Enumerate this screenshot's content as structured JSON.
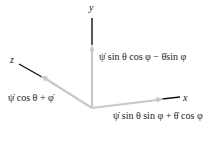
{
  "diagram": {
    "axes": {
      "x": {
        "label": "x",
        "component": "ψ̇  sin θ sin φ + θ̇ cos φ"
      },
      "y": {
        "label": "y",
        "component": "ψ̇ sin θ cos φ − θ̇sin  φ"
      },
      "z": {
        "label": "z",
        "component": "ψ̇ cos θ + φ̇"
      }
    },
    "colors": {
      "component_arrow": "#c8c8c8",
      "axis_line": "#111111",
      "text": "#222222"
    }
  }
}
